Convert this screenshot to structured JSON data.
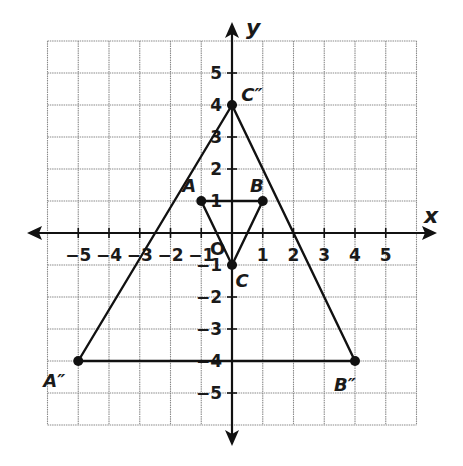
{
  "figure": {
    "x_axis_label": "x",
    "y_axis_label": "y",
    "origin_label": "O",
    "x_range": [
      -6,
      6
    ],
    "y_range": [
      -6,
      6
    ],
    "x_ticks": [
      {
        "value": -5,
        "label": "−5"
      },
      {
        "value": -4,
        "label": "−4"
      },
      {
        "value": -3,
        "label": "−3"
      },
      {
        "value": -2,
        "label": "−2"
      },
      {
        "value": -1,
        "label": "−1"
      },
      {
        "value": 1,
        "label": "1"
      },
      {
        "value": 2,
        "label": "2"
      },
      {
        "value": 3,
        "label": "3"
      },
      {
        "value": 4,
        "label": "4"
      },
      {
        "value": 5,
        "label": "5"
      }
    ],
    "y_ticks": [
      {
        "value": 5,
        "label": "5"
      },
      {
        "value": 4,
        "label": "4"
      },
      {
        "value": 3,
        "label": "3"
      },
      {
        "value": 2,
        "label": "2"
      },
      {
        "value": 1,
        "label": "1"
      },
      {
        "value": -1,
        "label": "−1"
      },
      {
        "value": -2,
        "label": "−2"
      },
      {
        "value": -3,
        "label": "−3"
      },
      {
        "value": -4,
        "label": "−4"
      },
      {
        "value": -5,
        "label": "−5"
      }
    ],
    "triangles": [
      {
        "name": "ABC",
        "vertices": [
          {
            "label": "A",
            "x": -1,
            "y": 1
          },
          {
            "label": "B",
            "x": 1,
            "y": 1
          },
          {
            "label": "C",
            "x": 0,
            "y": -1
          }
        ]
      },
      {
        "name": "A''B''C''",
        "vertices": [
          {
            "label": "A″",
            "x": -5,
            "y": -4
          },
          {
            "label": "B″",
            "x": 4,
            "y": -4
          },
          {
            "label": "C″",
            "x": 0,
            "y": 4
          }
        ]
      }
    ],
    "colors": {
      "line": "#111111",
      "grid": "#8a8a8a",
      "background": "#ffffff"
    }
  }
}
